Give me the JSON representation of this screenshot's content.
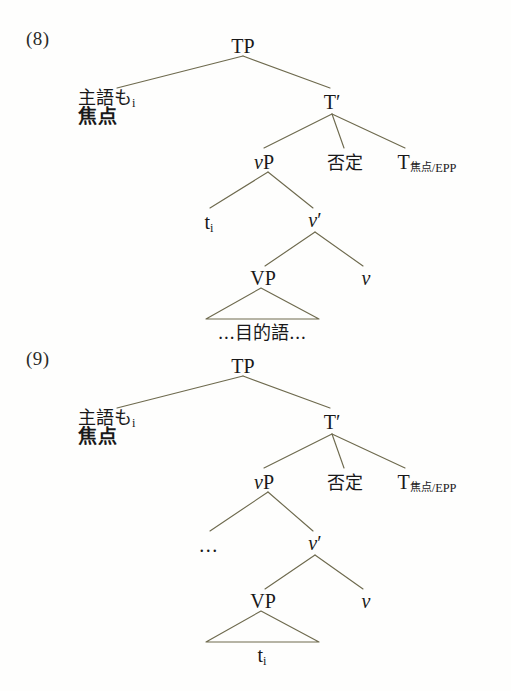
{
  "document": {
    "type": "linguistics-syntax-trees",
    "language": "Japanese",
    "background_color": "#fefefd",
    "line_color": "#6e6a4e",
    "text_color": "#19191a"
  },
  "figures": [
    {
      "number": "(8)",
      "nodes": {
        "root": "TP",
        "subject_line1_text": "主語も",
        "subject_line1_sub": "i",
        "subject_line2": "焦点",
        "tbar": "T′",
        "vp_small": "vP",
        "negation": "否定",
        "t_head": "T",
        "t_head_sub_jp": "焦点",
        "t_head_sub_rest": "/EPP",
        "spec_vp": "t",
        "spec_vp_sub": "i",
        "vbar": "v′",
        "vp_big": "VP",
        "little_v": "v",
        "triangle_content": "...目的語..."
      }
    },
    {
      "number": "(9)",
      "nodes": {
        "root": "TP",
        "subject_line1_text": "主語も",
        "subject_line1_sub": "i",
        "subject_line2": "焦点",
        "tbar": "T′",
        "vp_small": "vP",
        "negation": "否定",
        "t_head": "T",
        "t_head_sub_jp": "焦点",
        "t_head_sub_rest": "/EPP",
        "spec_vp": "...",
        "spec_vp_sub": "",
        "vbar": "v′",
        "vp_big": "VP",
        "little_v": "v",
        "triangle_content": "t",
        "triangle_content_sub": "i"
      }
    }
  ]
}
